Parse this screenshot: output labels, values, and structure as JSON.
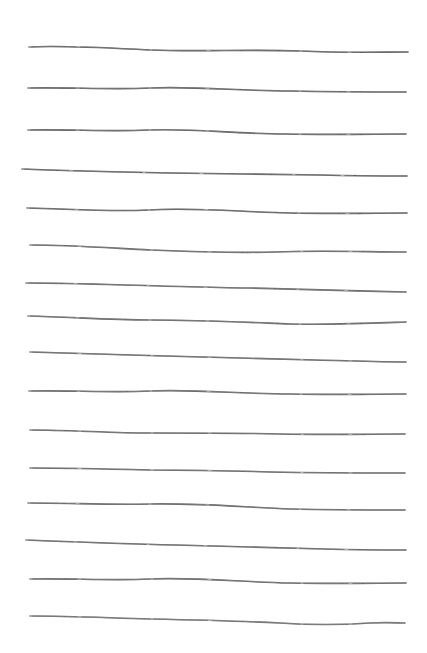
{
  "canvas": {
    "width": 427,
    "height": 653,
    "background_color": "#ffffff",
    "title": "Hand-drawn horizontal ruled lines"
  },
  "style": {
    "stroke_color": "#555555",
    "stroke_color_light": "#8a8a8a",
    "stroke_width": 1.6,
    "stroke_width_light": 1.0,
    "line_count": 16
  },
  "lines": [
    {
      "id": "line-1",
      "index": 1,
      "x_start": 29,
      "x_end": 408,
      "y_start": 47,
      "y_end": 52,
      "path": "M29,47 C60,45 110,48 150,50 C200,52 250,49 300,51 C345,53 380,52 408,52",
      "opacity": 0.95,
      "fade_segments": "left-tail"
    },
    {
      "id": "line-2",
      "index": 2,
      "x_start": 28,
      "x_end": 406,
      "y_start": 88,
      "y_end": 92,
      "path": "M28,88 C70,87 110,90 150,88 C195,86 240,91 290,91 C340,92 375,92 406,92",
      "opacity": 0.95,
      "fade_segments": "mid-right"
    },
    {
      "id": "line-3",
      "index": 3,
      "x_start": 28,
      "x_end": 406,
      "y_start": 129,
      "y_end": 134,
      "path": "M28,130 C70,129 110,132 148,130 C190,128 235,134 285,134 C335,135 375,134 406,134",
      "opacity": 0.95,
      "fade_segments": "mid-right"
    },
    {
      "id": "line-4",
      "index": 4,
      "x_start": 22,
      "x_end": 407,
      "y_start": 169,
      "y_end": 176,
      "path": "M22,169 C70,171 120,172 170,173 C220,174 270,174 320,175 C360,176 385,176 407,176",
      "opacity": 0.95,
      "fade_segments": "left-dashes"
    },
    {
      "id": "line-5",
      "index": 5,
      "x_start": 27,
      "x_end": 407,
      "y_start": 208,
      "y_end": 213,
      "path": "M27,208 C70,209 110,212 148,210 C195,207 240,212 290,213 C340,214 378,213 407,213",
      "opacity": 0.95,
      "fade_segments": "right-breaks"
    },
    {
      "id": "line-6",
      "index": 6,
      "x_start": 30,
      "x_end": 406,
      "y_start": 245,
      "y_end": 252,
      "path": "M30,245 C70,245 110,248 150,250 C200,252 240,253 275,252 C320,250 370,252 406,252",
      "opacity": 0.9,
      "fade_segments": "left-tail"
    },
    {
      "id": "line-7",
      "index": 7,
      "x_start": 26,
      "x_end": 406,
      "y_start": 283,
      "y_end": 292,
      "path": "M26,283 C70,283 120,285 160,286 C200,287 230,288 250,288 C290,289 350,291 406,292",
      "opacity": 0.9,
      "fade_segments": "mid-dots"
    },
    {
      "id": "line-8",
      "index": 8,
      "x_start": 28,
      "x_end": 406,
      "y_start": 316,
      "y_end": 323,
      "path": "M28,316 C70,317 110,320 150,320 C200,320 240,322 290,324 C335,325 378,323 406,322",
      "opacity": 0.9,
      "fade_segments": "left-dashes"
    },
    {
      "id": "line-9",
      "index": 9,
      "x_start": 30,
      "x_end": 406,
      "y_start": 352,
      "y_end": 362,
      "path": "M30,352 C75,353 120,355 165,356 C215,357 265,359 315,360 C355,361 382,362 406,362",
      "opacity": 0.9,
      "fade_segments": "left-dashes"
    },
    {
      "id": "line-10",
      "index": 10,
      "x_start": 29,
      "x_end": 406,
      "y_start": 390,
      "y_end": 394,
      "path": "M29,391 C70,390 110,393 150,391 C195,389 240,394 290,394 C340,395 378,394 406,394",
      "opacity": 0.9,
      "fade_segments": "right-breaks"
    },
    {
      "id": "line-11",
      "index": 11,
      "x_start": 30,
      "x_end": 405,
      "y_start": 430,
      "y_end": 434,
      "path": "M30,430 C70,430 110,433 150,433 C200,433 240,433 280,434 C330,435 375,434 405,434",
      "opacity": 0.9,
      "fade_segments": "left-tail"
    },
    {
      "id": "line-12",
      "index": 12,
      "x_start": 30,
      "x_end": 405,
      "y_start": 468,
      "y_end": 473,
      "path": "M30,468 C70,468 110,469 150,470 C200,470 240,471 270,472 C320,473 370,473 405,473",
      "opacity": 0.9,
      "fade_segments": "left-dots"
    },
    {
      "id": "line-13",
      "index": 13,
      "x_start": 28,
      "x_end": 405,
      "y_start": 503,
      "y_end": 510,
      "path": "M28,503 C70,503 110,505 150,504 C200,503 240,507 290,509 C335,510 378,510 405,510",
      "opacity": 0.9,
      "fade_segments": "mid-break"
    },
    {
      "id": "line-14",
      "index": 14,
      "x_start": 26,
      "x_end": 406,
      "y_start": 540,
      "y_end": 550,
      "path": "M26,540 C75,542 125,544 175,545 C225,546 275,548 325,549 C360,550 385,550 406,550",
      "opacity": 0.9,
      "fade_segments": "mid-dots"
    },
    {
      "id": "line-15",
      "index": 15,
      "x_start": 30,
      "x_end": 406,
      "y_start": 578,
      "y_end": 583,
      "path": "M30,579 C70,578 110,581 150,579 C195,577 240,582 290,583 C340,584 378,583 406,583",
      "opacity": 0.9,
      "fade_segments": "right-breaks"
    },
    {
      "id": "line-16",
      "index": 16,
      "x_start": 30,
      "x_end": 405,
      "y_start": 616,
      "y_end": 624,
      "path": "M30,616 C70,616 110,618 150,619 C200,620 240,621 280,623 C310,625 340,625 370,623 C388,622 398,623 405,623",
      "opacity": 0.85,
      "fade_segments": "left-dots"
    }
  ]
}
